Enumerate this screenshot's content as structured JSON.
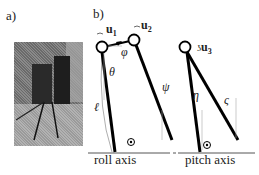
{
  "panels": {
    "a": {
      "label": "a)",
      "content": "photo of tripod-legged robot"
    },
    "b": {
      "label": "b)"
    }
  },
  "inputs": {
    "u1": {
      "base": "u",
      "sub": "1"
    },
    "u2": {
      "base": "u",
      "sub": "2"
    },
    "u3": {
      "base": "u",
      "sub": "3"
    }
  },
  "angles": {
    "theta": "θ",
    "phi": "φ",
    "psi": "ψ",
    "ell": "ℓ",
    "eta": "η",
    "zeta": "ς"
  },
  "axes": {
    "roll": "roll axis",
    "pitch": "pitch axis"
  }
}
